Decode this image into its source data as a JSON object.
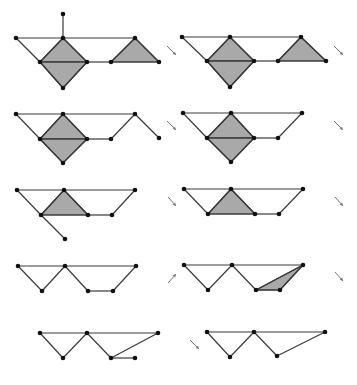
{
  "colors": {
    "edge": "#3a3a3a",
    "face": "#a9a9a9",
    "vertex": "#111111",
    "arrow": "#777777",
    "background": "#ffffff"
  },
  "panels": [
    {
      "id": "r1c1",
      "vertices": [
        [
          63,
          14
        ],
        [
          16,
          38
        ],
        [
          63,
          38
        ],
        [
          40,
          62
        ],
        [
          87,
          62
        ],
        [
          63,
          88
        ],
        [
          111,
          62
        ],
        [
          135,
          38
        ],
        [
          159,
          62
        ]
      ],
      "faces": [
        [
          [
            63,
            38
          ],
          [
            40,
            62
          ],
          [
            87,
            62
          ]
        ],
        [
          [
            40,
            62
          ],
          [
            87,
            62
          ],
          [
            63,
            88
          ]
        ],
        [
          [
            135,
            38
          ],
          [
            111,
            62
          ],
          [
            159,
            62
          ]
        ]
      ],
      "edges": [
        [
          [
            63,
            14
          ],
          [
            63,
            38
          ]
        ],
        [
          [
            16,
            38
          ],
          [
            135,
            38
          ]
        ],
        [
          [
            16,
            38
          ],
          [
            40,
            62
          ]
        ],
        [
          [
            63,
            38
          ],
          [
            40,
            62
          ]
        ],
        [
          [
            63,
            38
          ],
          [
            87,
            62
          ]
        ],
        [
          [
            40,
            62
          ],
          [
            87,
            62
          ]
        ],
        [
          [
            40,
            62
          ],
          [
            63,
            88
          ]
        ],
        [
          [
            87,
            62
          ],
          [
            63,
            88
          ]
        ],
        [
          [
            87,
            62
          ],
          [
            111,
            62
          ]
        ],
        [
          [
            135,
            38
          ],
          [
            111,
            62
          ]
        ],
        [
          [
            135,
            38
          ],
          [
            159,
            62
          ]
        ],
        [
          [
            111,
            62
          ],
          [
            159,
            62
          ]
        ]
      ]
    },
    {
      "id": "r1c2",
      "vertices": [
        [
          182,
          37
        ],
        [
          230,
          37
        ],
        [
          301,
          37
        ],
        [
          207,
          61
        ],
        [
          254,
          61
        ],
        [
          230,
          87
        ],
        [
          278,
          61
        ],
        [
          326,
          61
        ]
      ],
      "faces": [
        [
          [
            230,
            37
          ],
          [
            207,
            61
          ],
          [
            254,
            61
          ]
        ],
        [
          [
            207,
            61
          ],
          [
            254,
            61
          ],
          [
            230,
            87
          ]
        ],
        [
          [
            301,
            37
          ],
          [
            278,
            61
          ],
          [
            326,
            61
          ]
        ]
      ],
      "edges": [
        [
          [
            182,
            37
          ],
          [
            301,
            37
          ]
        ],
        [
          [
            182,
            37
          ],
          [
            207,
            61
          ]
        ],
        [
          [
            230,
            37
          ],
          [
            207,
            61
          ]
        ],
        [
          [
            230,
            37
          ],
          [
            254,
            61
          ]
        ],
        [
          [
            207,
            61
          ],
          [
            254,
            61
          ]
        ],
        [
          [
            207,
            61
          ],
          [
            230,
            87
          ]
        ],
        [
          [
            254,
            61
          ],
          [
            230,
            87
          ]
        ],
        [
          [
            254,
            61
          ],
          [
            278,
            61
          ]
        ],
        [
          [
            301,
            37
          ],
          [
            278,
            61
          ]
        ],
        [
          [
            301,
            37
          ],
          [
            326,
            61
          ]
        ],
        [
          [
            278,
            61
          ],
          [
            326,
            61
          ]
        ]
      ]
    },
    {
      "id": "r2c1",
      "vertices": [
        [
          16,
          114
        ],
        [
          63,
          114
        ],
        [
          135,
          114
        ],
        [
          40,
          139
        ],
        [
          87,
          139
        ],
        [
          111,
          139
        ],
        [
          63,
          163
        ],
        [
          159,
          138
        ]
      ],
      "faces": [
        [
          [
            63,
            114
          ],
          [
            40,
            139
          ],
          [
            87,
            139
          ]
        ],
        [
          [
            40,
            139
          ],
          [
            87,
            139
          ],
          [
            63,
            163
          ]
        ]
      ],
      "edges": [
        [
          [
            16,
            114
          ],
          [
            135,
            114
          ]
        ],
        [
          [
            16,
            114
          ],
          [
            40,
            139
          ]
        ],
        [
          [
            63,
            114
          ],
          [
            40,
            139
          ]
        ],
        [
          [
            63,
            114
          ],
          [
            87,
            139
          ]
        ],
        [
          [
            40,
            139
          ],
          [
            87,
            139
          ]
        ],
        [
          [
            40,
            139
          ],
          [
            63,
            163
          ]
        ],
        [
          [
            87,
            139
          ],
          [
            63,
            163
          ]
        ],
        [
          [
            87,
            139
          ],
          [
            111,
            139
          ]
        ],
        [
          [
            135,
            114
          ],
          [
            111,
            139
          ]
        ],
        [
          [
            135,
            114
          ],
          [
            159,
            138
          ]
        ]
      ]
    },
    {
      "id": "r2c2",
      "vertices": [
        [
          183,
          113
        ],
        [
          231,
          113
        ],
        [
          302,
          113
        ],
        [
          207,
          138
        ],
        [
          254,
          138
        ],
        [
          278,
          138
        ],
        [
          231,
          162
        ]
      ],
      "faces": [
        [
          [
            231,
            113
          ],
          [
            207,
            138
          ],
          [
            254,
            138
          ]
        ],
        [
          [
            207,
            138
          ],
          [
            254,
            138
          ],
          [
            231,
            162
          ]
        ]
      ],
      "edges": [
        [
          [
            183,
            113
          ],
          [
            302,
            113
          ]
        ],
        [
          [
            183,
            113
          ],
          [
            207,
            138
          ]
        ],
        [
          [
            231,
            113
          ],
          [
            207,
            138
          ]
        ],
        [
          [
            231,
            113
          ],
          [
            254,
            138
          ]
        ],
        [
          [
            207,
            138
          ],
          [
            254,
            138
          ]
        ],
        [
          [
            207,
            138
          ],
          [
            231,
            162
          ]
        ],
        [
          [
            254,
            138
          ],
          [
            231,
            162
          ]
        ],
        [
          [
            254,
            138
          ],
          [
            278,
            138
          ]
        ],
        [
          [
            302,
            113
          ],
          [
            278,
            138
          ]
        ]
      ]
    },
    {
      "id": "r3c1",
      "vertices": [
        [
          17,
          190
        ],
        [
          64,
          190
        ],
        [
          135,
          190
        ],
        [
          41,
          215
        ],
        [
          88,
          215
        ],
        [
          112,
          215
        ],
        [
          65,
          239
        ]
      ],
      "faces": [
        [
          [
            64,
            190
          ],
          [
            41,
            215
          ],
          [
            88,
            215
          ]
        ]
      ],
      "edges": [
        [
          [
            17,
            190
          ],
          [
            135,
            190
          ]
        ],
        [
          [
            17,
            190
          ],
          [
            41,
            215
          ]
        ],
        [
          [
            41,
            215
          ],
          [
            65,
            239
          ]
        ],
        [
          [
            64,
            190
          ],
          [
            41,
            215
          ]
        ],
        [
          [
            64,
            190
          ],
          [
            88,
            215
          ]
        ],
        [
          [
            41,
            215
          ],
          [
            88,
            215
          ]
        ],
        [
          [
            88,
            215
          ],
          [
            112,
            215
          ]
        ],
        [
          [
            135,
            190
          ],
          [
            112,
            215
          ]
        ]
      ]
    },
    {
      "id": "r3c2",
      "vertices": [
        [
          184,
          189
        ],
        [
          231,
          189
        ],
        [
          303,
          189
        ],
        [
          208,
          214
        ],
        [
          255,
          214
        ],
        [
          279,
          214
        ]
      ],
      "faces": [
        [
          [
            231,
            189
          ],
          [
            208,
            214
          ],
          [
            255,
            214
          ]
        ]
      ],
      "edges": [
        [
          [
            184,
            189
          ],
          [
            303,
            189
          ]
        ],
        [
          [
            184,
            189
          ],
          [
            208,
            214
          ]
        ],
        [
          [
            231,
            189
          ],
          [
            208,
            214
          ]
        ],
        [
          [
            231,
            189
          ],
          [
            255,
            214
          ]
        ],
        [
          [
            208,
            214
          ],
          [
            255,
            214
          ]
        ],
        [
          [
            255,
            214
          ],
          [
            279,
            214
          ]
        ],
        [
          [
            303,
            189
          ],
          [
            279,
            214
          ]
        ]
      ]
    },
    {
      "id": "r4c1",
      "vertices": [
        [
          18,
          266
        ],
        [
          65,
          266
        ],
        [
          136,
          266
        ],
        [
          42,
          291
        ],
        [
          88,
          291
        ],
        [
          113,
          291
        ]
      ],
      "faces": [],
      "edges": [
        [
          [
            18,
            266
          ],
          [
            136,
            266
          ]
        ],
        [
          [
            18,
            266
          ],
          [
            42,
            291
          ]
        ],
        [
          [
            65,
            266
          ],
          [
            42,
            291
          ]
        ],
        [
          [
            65,
            266
          ],
          [
            88,
            291
          ]
        ],
        [
          [
            88,
            291
          ],
          [
            113,
            291
          ]
        ],
        [
          [
            136,
            266
          ],
          [
            113,
            291
          ]
        ]
      ]
    },
    {
      "id": "r4c2",
      "vertices": [
        [
          184,
          265
        ],
        [
          232,
          265
        ],
        [
          303,
          265
        ],
        [
          208,
          290
        ],
        [
          256,
          290
        ],
        [
          280,
          290
        ]
      ],
      "faces": [
        [
          [
            256,
            290
          ],
          [
            280,
            290
          ],
          [
            303,
            265
          ]
        ]
      ],
      "edges": [
        [
          [
            184,
            265
          ],
          [
            303,
            265
          ]
        ],
        [
          [
            184,
            265
          ],
          [
            208,
            290
          ]
        ],
        [
          [
            232,
            265
          ],
          [
            208,
            290
          ]
        ],
        [
          [
            232,
            265
          ],
          [
            256,
            290
          ]
        ],
        [
          [
            256,
            290
          ],
          [
            280,
            290
          ]
        ],
        [
          [
            303,
            265
          ],
          [
            280,
            290
          ]
        ],
        [
          [
            303,
            265
          ],
          [
            256,
            290
          ]
        ]
      ]
    },
    {
      "id": "r5c1",
      "vertices": [
        [
          40,
          333
        ],
        [
          87,
          333
        ],
        [
          158,
          333
        ],
        [
          63,
          358
        ],
        [
          111,
          358
        ],
        [
          135,
          358
        ]
      ],
      "faces": [],
      "edges": [
        [
          [
            40,
            333
          ],
          [
            158,
            333
          ]
        ],
        [
          [
            40,
            333
          ],
          [
            63,
            358
          ]
        ],
        [
          [
            87,
            333
          ],
          [
            63,
            358
          ]
        ],
        [
          [
            87,
            333
          ],
          [
            111,
            358
          ]
        ],
        [
          [
            111,
            358
          ],
          [
            135,
            358
          ]
        ],
        [
          [
            158,
            333
          ],
          [
            111,
            358
          ]
        ]
      ]
    },
    {
      "id": "r5c2",
      "vertices": [
        [
          207,
          332
        ],
        [
          254,
          332
        ],
        [
          325,
          332
        ],
        [
          230,
          357
        ],
        [
          277,
          356
        ]
      ],
      "faces": [],
      "edges": [
        [
          [
            207,
            332
          ],
          [
            325,
            332
          ]
        ],
        [
          [
            207,
            332
          ],
          [
            230,
            357
          ]
        ],
        [
          [
            254,
            332
          ],
          [
            230,
            357
          ]
        ],
        [
          [
            254,
            332
          ],
          [
            277,
            356
          ]
        ],
        [
          [
            325,
            332
          ],
          [
            277,
            356
          ]
        ]
      ]
    }
  ],
  "arrows": [
    {
      "id": "arrow-r1-a",
      "direction": "down-right",
      "from": [
        167,
        46
      ],
      "to": [
        176,
        55
      ]
    },
    {
      "id": "arrow-r1-b",
      "direction": "down-right",
      "from": [
        334,
        46
      ],
      "to": [
        343,
        55
      ]
    },
    {
      "id": "arrow-r2-a",
      "direction": "down-right",
      "from": [
        167,
        121
      ],
      "to": [
        176,
        130
      ]
    },
    {
      "id": "arrow-r2-b",
      "direction": "down-right",
      "from": [
        334,
        121
      ],
      "to": [
        343,
        130
      ]
    },
    {
      "id": "arrow-r3-a",
      "direction": "down-right",
      "from": [
        168,
        197
      ],
      "to": [
        176,
        206
      ]
    },
    {
      "id": "arrow-r3-b",
      "direction": "down-right",
      "from": [
        335,
        197
      ],
      "to": [
        343,
        206
      ]
    },
    {
      "id": "arrow-r4-a",
      "direction": "up-right",
      "from": [
        168,
        283
      ],
      "to": [
        176,
        274
      ]
    },
    {
      "id": "arrow-r4-b",
      "direction": "up-right",
      "from": [
        168,
        283
      ],
      "to": [
        177,
        274
      ]
    },
    {
      "id": "arrow-r4-c",
      "direction": "down-right",
      "from": [
        335,
        272
      ],
      "to": [
        343,
        281
      ]
    },
    {
      "id": "arrow-r5-a",
      "direction": "down-right",
      "from": [
        190,
        340
      ],
      "to": [
        199,
        349
      ]
    }
  ]
}
